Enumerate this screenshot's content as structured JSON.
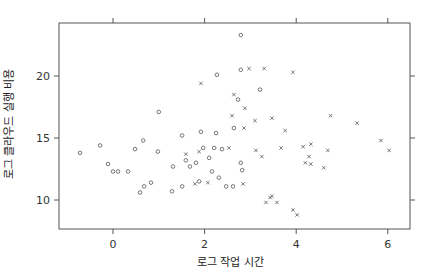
{
  "chart_data": {
    "type": "scatter",
    "title": "",
    "xlabel": "로그 작업 시간",
    "ylabel": "로그 클라우드 실행 비용",
    "xlim": [
      -1.2,
      6.4
    ],
    "ylim": [
      6.3,
      24.6
    ],
    "xticks": [
      0,
      2,
      4,
      6
    ],
    "yticks": [
      10,
      15,
      20
    ],
    "grid": false,
    "legend": null,
    "series": [
      {
        "name": "o",
        "marker": "circle",
        "points": [
          [
            -0.72,
            13.8
          ],
          [
            -0.28,
            14.4
          ],
          [
            -0.11,
            12.9
          ],
          [
            0.0,
            12.3
          ],
          [
            0.11,
            12.3
          ],
          [
            0.33,
            12.3
          ],
          [
            0.48,
            14.1
          ],
          [
            0.66,
            14.8
          ],
          [
            0.59,
            10.6
          ],
          [
            0.68,
            11.1
          ],
          [
            0.83,
            11.4
          ],
          [
            1.0,
            17.1
          ],
          [
            0.98,
            13.9
          ],
          [
            1.31,
            12.7
          ],
          [
            1.29,
            10.7
          ],
          [
            1.51,
            11.1
          ],
          [
            1.51,
            15.2
          ],
          [
            1.59,
            13.2
          ],
          [
            1.68,
            12.7
          ],
          [
            1.81,
            13.0
          ],
          [
            1.88,
            11.5
          ],
          [
            1.92,
            15.5
          ],
          [
            1.97,
            14.2
          ],
          [
            2.1,
            13.4
          ],
          [
            2.16,
            12.3
          ],
          [
            2.31,
            11.8
          ],
          [
            2.47,
            11.1
          ],
          [
            2.62,
            11.1
          ],
          [
            2.25,
            15.4
          ],
          [
            2.21,
            14.2
          ],
          [
            2.38,
            14.1
          ],
          [
            2.27,
            20.1
          ],
          [
            2.79,
            23.3
          ],
          [
            2.79,
            20.5
          ],
          [
            2.73,
            18.1
          ],
          [
            3.21,
            18.9
          ],
          [
            2.64,
            15.8
          ],
          [
            2.79,
            13.0
          ],
          [
            2.82,
            12.4
          ]
        ]
      },
      {
        "name": "x",
        "marker": "cross",
        "points": [
          [
            1.92,
            19.4
          ],
          [
            2.64,
            18.5
          ],
          [
            2.97,
            20.6
          ],
          [
            3.3,
            20.6
          ],
          [
            3.93,
            20.3
          ],
          [
            2.88,
            17.4
          ],
          [
            3.1,
            16.4
          ],
          [
            2.86,
            15.8
          ],
          [
            2.6,
            16.8
          ],
          [
            1.88,
            13.9
          ],
          [
            1.59,
            13.7
          ],
          [
            2.53,
            14.2
          ],
          [
            3.25,
            13.5
          ],
          [
            3.12,
            14.0
          ],
          [
            2.84,
            11.3
          ],
          [
            1.79,
            11.3
          ],
          [
            2.07,
            11.4
          ],
          [
            3.67,
            14.2
          ],
          [
            4.15,
            14.3
          ],
          [
            4.32,
            14.5
          ],
          [
            3.76,
            15.6
          ],
          [
            4.75,
            16.8
          ],
          [
            4.2,
            13.0
          ],
          [
            4.32,
            12.9
          ],
          [
            4.28,
            13.5
          ],
          [
            4.69,
            14.0
          ],
          [
            4.6,
            12.6
          ],
          [
            5.33,
            16.2
          ],
          [
            5.85,
            14.8
          ],
          [
            6.03,
            14.0
          ],
          [
            3.47,
            10.3
          ],
          [
            3.43,
            10.2
          ],
          [
            3.34,
            9.8
          ],
          [
            3.58,
            9.8
          ],
          [
            3.93,
            9.2
          ],
          [
            4.02,
            8.8
          ],
          [
            3.47,
            16.6
          ]
        ]
      }
    ]
  },
  "colors": {
    "axis": "#555555",
    "marker": "#555555",
    "background": "#ffffff"
  },
  "layout": {
    "plot_left": 59,
    "plot_right": 410,
    "plot_top": 23,
    "plot_bottom": 229
  }
}
